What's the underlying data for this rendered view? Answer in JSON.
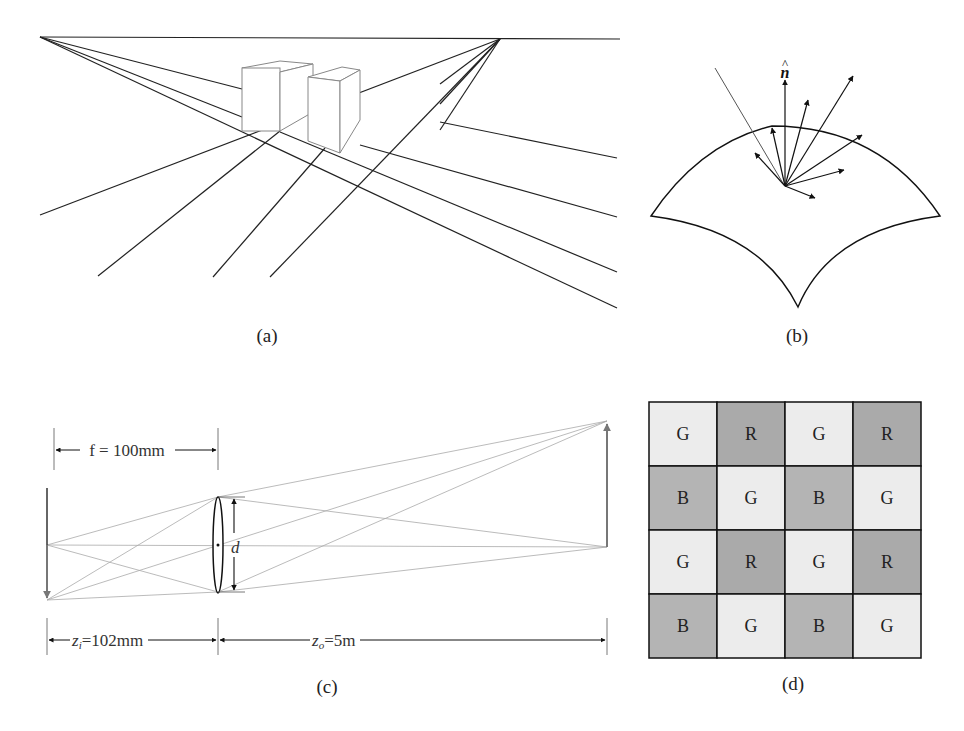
{
  "panels": {
    "a": {
      "caption": "(a)",
      "description": "two-point perspective with boxes"
    },
    "b": {
      "caption": "(b)",
      "normal_label": "n",
      "normal_hat": "^"
    },
    "c": {
      "caption": "(c)",
      "f_label": "f = 100mm",
      "d_label": "d",
      "zi_label": "z",
      "zi_sub": "i",
      "zi_value": "=102mm",
      "zo_label": "z",
      "zo_sub": "o",
      "zo_value": "=5m"
    },
    "d": {
      "caption": "(d)",
      "grid": [
        [
          "G",
          "R",
          "G",
          "R"
        ],
        [
          "B",
          "G",
          "B",
          "G"
        ],
        [
          "G",
          "R",
          "G",
          "R"
        ],
        [
          "B",
          "G",
          "B",
          "G"
        ]
      ],
      "colors": {
        "G": "#ececec",
        "R": "#aaaaaa",
        "B": "#b4b4b4"
      }
    }
  }
}
